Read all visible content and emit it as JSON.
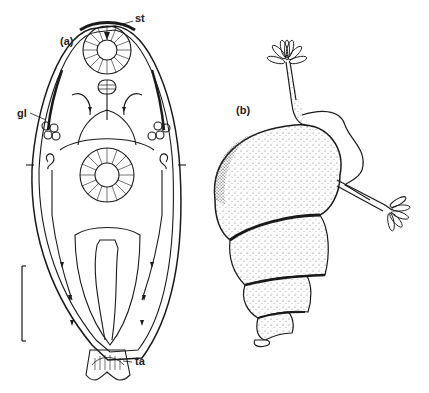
{
  "figure": {
    "panels": [
      {
        "id": "a",
        "label": "(a)",
        "subject": "rotifer-like organism, dorsal outline view",
        "annotations": [
          {
            "abbr": "st",
            "position": "anterior apex"
          },
          {
            "abbr": "gl",
            "position": "lateral gland cluster, left"
          },
          {
            "abbr": "ta",
            "position": "posterior toe/foot"
          }
        ],
        "scale_bar": "vertical, left side, unlabeled"
      },
      {
        "id": "b",
        "label": "(b)",
        "subject": "spiral gastropod shell with two extended tentacle crowns"
      }
    ]
  },
  "colors": {
    "ink": "#1a1a1a",
    "background": "#ffffff",
    "stipple": "#444444"
  }
}
